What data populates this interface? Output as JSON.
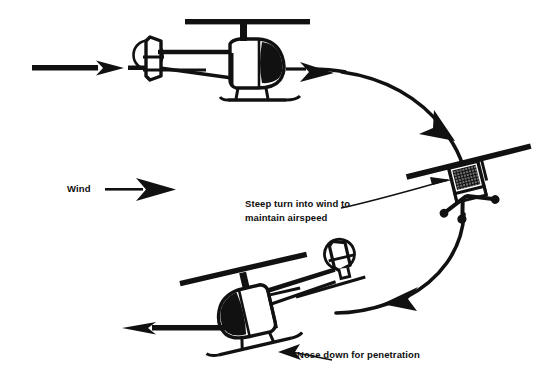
{
  "diagram": {
    "background_color": "#ffffff",
    "ink_color": "#111111",
    "labels": {
      "wind": "Wind",
      "steep_turn_line1": "Steep turn into wind to",
      "steep_turn_line2": "maintain airspeed",
      "nose_down": "Nose down for penetration"
    },
    "icons": {
      "wind_arrow": "arrow-right-icon",
      "entry_arrow": "arrow-right-icon",
      "path_arrow_1": "arrow-right-icon",
      "path_arrow_2": "arrow-down-right-icon",
      "path_arrow_3": "arrow-left-icon",
      "exit_arrow": "arrow-left-icon",
      "steep_turn_leader": "leader-line-arrow-icon",
      "nose_down_leader": "leader-line-arrow-icon"
    },
    "aircraft": [
      {
        "name": "helicopter-upwind-level",
        "view": "side-view-facing-right",
        "attitude": "level",
        "position": "top-left"
      },
      {
        "name": "helicopter-banked-turn",
        "view": "front-view-banked",
        "attitude": "steep-bank",
        "position": "right"
      },
      {
        "name": "helicopter-downwind-nose-down",
        "view": "side-view-facing-left",
        "attitude": "nose-down",
        "position": "bottom-left"
      }
    ],
    "flight_path": {
      "description": "curved path from upwind leg through steep turn to downwind exit",
      "direction": "clockwise"
    }
  }
}
